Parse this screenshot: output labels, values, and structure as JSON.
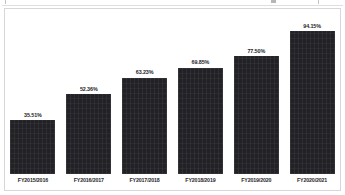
{
  "chart_data": {
    "type": "bar",
    "title": "",
    "subtitle": "",
    "xlabel": "",
    "ylabel": "",
    "grid": false,
    "legend": false,
    "legend_position": "none",
    "axis_line": false,
    "ylim": [
      0,
      100
    ],
    "value_suffix": "%",
    "categories": [
      "FY2015/2016",
      "FY2016/2017",
      "FY2017/2018",
      "FY2018/2019",
      "FY2019/2020",
      "FY2020/2021"
    ],
    "values": [
      35.51,
      52.36,
      63.23,
      69.85,
      77.5,
      94.15
    ],
    "data_labels": [
      "35.51%",
      "52.36%",
      "63.23%",
      "69.85%",
      "77.50%",
      "94.15%"
    ],
    "bar_color": "#222226",
    "label_color": "#1d1d1f",
    "background_color": "#ffffff",
    "frame_color": "#d7d7db"
  }
}
